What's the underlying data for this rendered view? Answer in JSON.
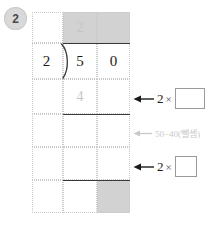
{
  "problem": {
    "number": "2"
  },
  "long_division": {
    "divisor": "2",
    "dividend_digits": [
      "5",
      "0"
    ],
    "quotient_digits": [
      "2",
      ""
    ],
    "partial_product": "4",
    "columns": 3,
    "rows": 6,
    "ghost_color": "#c6c6c6",
    "shade_color": "#d2d2d2",
    "rule_color": "#3a3a3a",
    "cell_border_color": "#c9c9c9",
    "bracket_symbol": ")"
  },
  "annotations": [
    {
      "id": "step-multiply-tens",
      "arrow": "←",
      "factor": "2",
      "operator": "×",
      "blank": "",
      "style": "solid"
    },
    {
      "id": "step-subtract",
      "arrow": "←",
      "text": "50−40(뺄셈)",
      "style": "faint"
    },
    {
      "id": "step-multiply-ones",
      "arrow": "←",
      "factor": "2",
      "operator": "×",
      "blank": "",
      "style": "solid"
    }
  ],
  "colors": {
    "badge_bg": "#d9d9d9",
    "badge_text": "#4a4a4a",
    "ink": "#1a1a1a",
    "faint": "#c9c9c9"
  }
}
